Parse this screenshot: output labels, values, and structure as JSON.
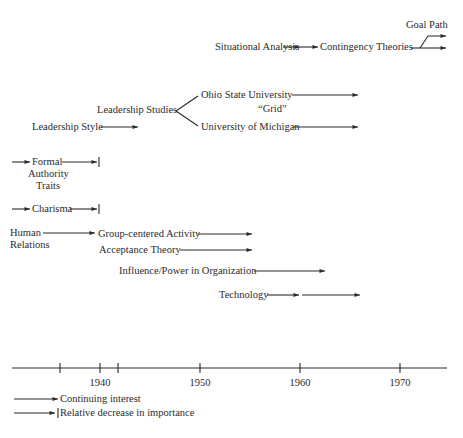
{
  "diagram": {
    "nodes": {
      "goal_path": "Goal Path",
      "situational_analysis": "Situational Analysis",
      "contingency_theories": "Contingency Theories",
      "ohio_state": "Ohio State University",
      "grid": "“Grid”",
      "leadership_studies": "Leadership Studies",
      "leadership_style": "Leadership Style",
      "university_michigan": "University of Michigan",
      "formal": "Formal",
      "authority": "Authority",
      "traits": "Traits",
      "charisma": "Charisma",
      "human": "Human",
      "relations": "Relations",
      "group_centered": "Group-centered Activity",
      "acceptance_theory": "Acceptance Theory",
      "influence_power": "Influence/Power in Organization",
      "technology": "Technology"
    },
    "axis": {
      "ticks": [
        "1940",
        "1950",
        "1960",
        "1970"
      ],
      "unlabeled_ticks": [
        "~1936",
        "~1942"
      ]
    },
    "legend": {
      "continuing": "Continuing interest",
      "decrease": "Relative decrease in importance"
    },
    "colors": {
      "ink": "#2a2a2a",
      "background": "#ffffff"
    }
  }
}
